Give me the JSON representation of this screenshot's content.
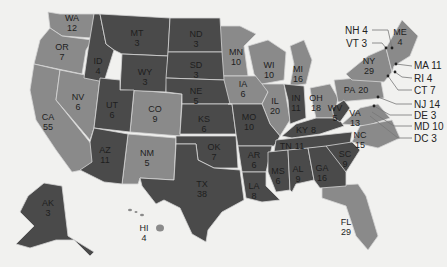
{
  "colors": {
    "background": "#f1f1ef",
    "party_a": "#4a4a4a",
    "party_b": "#8a8a8a",
    "border": "#d6d6d6",
    "label_text": "#1e1e1e"
  },
  "states": {
    "WA": {
      "abbr": "WA",
      "votes": "12"
    },
    "OR": {
      "abbr": "OR",
      "votes": "7"
    },
    "CA": {
      "abbr": "CA",
      "votes": "55"
    },
    "NV": {
      "abbr": "NV",
      "votes": "6"
    },
    "ID": {
      "abbr": "ID",
      "votes": "4"
    },
    "MT": {
      "abbr": "MT",
      "votes": "3"
    },
    "WY": {
      "abbr": "WY",
      "votes": "3"
    },
    "UT": {
      "abbr": "UT",
      "votes": "6"
    },
    "AZ": {
      "abbr": "AZ",
      "votes": "11"
    },
    "CO": {
      "abbr": "CO",
      "votes": "9"
    },
    "NM": {
      "abbr": "NM",
      "votes": "5"
    },
    "ND": {
      "abbr": "ND",
      "votes": "3"
    },
    "SD": {
      "abbr": "SD",
      "votes": "3"
    },
    "NE": {
      "abbr": "NE",
      "votes": "5"
    },
    "KS": {
      "abbr": "KS",
      "votes": "6"
    },
    "OK": {
      "abbr": "OK",
      "votes": "7"
    },
    "TX": {
      "abbr": "TX",
      "votes": "38"
    },
    "MN": {
      "abbr": "MN",
      "votes": "10"
    },
    "IA": {
      "abbr": "IA",
      "votes": "6"
    },
    "MO": {
      "abbr": "MO",
      "votes": "10"
    },
    "AR": {
      "abbr": "AR",
      "votes": "6"
    },
    "LA": {
      "abbr": "LA",
      "votes": "8"
    },
    "WI": {
      "abbr": "WI",
      "votes": "10"
    },
    "IL": {
      "abbr": "IL",
      "votes": "20"
    },
    "MI": {
      "abbr": "MI",
      "votes": "16"
    },
    "IN": {
      "abbr": "IN",
      "votes": "11"
    },
    "OH": {
      "abbr": "OH",
      "votes": "18"
    },
    "KY": {
      "abbr": "KY",
      "votes": "8"
    },
    "TN": {
      "abbr": "TN",
      "votes": "11"
    },
    "MS": {
      "abbr": "MS",
      "votes": "6"
    },
    "AL": {
      "abbr": "AL",
      "votes": "9"
    },
    "GA": {
      "abbr": "GA",
      "votes": "16"
    },
    "FL": {
      "abbr": "FL",
      "votes": "29"
    },
    "SC": {
      "abbr": "SC",
      "votes": "9"
    },
    "NC": {
      "abbr": "NC",
      "votes": "15"
    },
    "VA": {
      "abbr": "VA",
      "votes": "13"
    },
    "WV": {
      "abbr": "WV",
      "votes": "5"
    },
    "PA": {
      "abbr": "PA",
      "votes": "20"
    },
    "NY": {
      "abbr": "NY",
      "votes": "29"
    },
    "ME": {
      "abbr": "ME",
      "votes": "4"
    },
    "AK": {
      "abbr": "AK",
      "votes": "3"
    },
    "HI": {
      "abbr": "HI",
      "votes": "4"
    }
  },
  "callouts": {
    "NH": "NH 4",
    "VT": "VT 3",
    "MA": "MA 11",
    "RI": "RI 4",
    "CT": "CT 7",
    "NJ": "NJ 14",
    "DE": "DE 3",
    "MD": "MD 10",
    "DC": "DC 3"
  }
}
